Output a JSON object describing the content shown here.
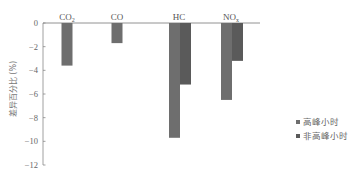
{
  "chart_data": {
    "type": "bar",
    "title": "",
    "xlabel": "",
    "ylabel": "差异百分比 (%)",
    "categories": [
      "CO2",
      "CO",
      "HC",
      "NOx"
    ],
    "category_labels": [
      {
        "base": "CO",
        "sub": "2"
      },
      {
        "base": "CO",
        "sub": ""
      },
      {
        "base": "HC",
        "sub": ""
      },
      {
        "base": "NO",
        "sub": "x"
      }
    ],
    "series": [
      {
        "name": "高峰小时",
        "color": "#6e6e6e",
        "values": [
          -3.6,
          -1.7,
          -9.7,
          -6.5
        ]
      },
      {
        "name": "非高峰小时",
        "color": "#5a5a5a",
        "values": [
          null,
          null,
          -5.2,
          -3.2
        ]
      }
    ],
    "ylim": [
      -12,
      0
    ],
    "yticks": [
      0,
      -2,
      -4,
      -6,
      -8,
      -10,
      -12
    ],
    "grid": false,
    "legend_position": "right"
  },
  "legend": {
    "items": [
      {
        "label": "高峰小时",
        "color": "#6e6e6e"
      },
      {
        "label": "非高峰小时",
        "color": "#5a5a5a"
      }
    ]
  }
}
